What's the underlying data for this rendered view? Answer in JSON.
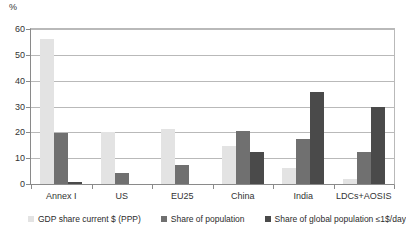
{
  "chart_data": {
    "type": "bar",
    "title": "",
    "subtitle": "",
    "xlabel": "",
    "ylabel": "%",
    "unit_label": "%",
    "ylim": [
      0,
      60
    ],
    "ytick_step": 10,
    "yticks": [
      "0",
      "10",
      "20",
      "30",
      "40",
      "50",
      "60"
    ],
    "grid": true,
    "grid_orientation": "horizontal",
    "legend_position": "bottom",
    "categories": [
      "Annex I",
      "US",
      "EU25",
      "China",
      "India",
      "LDCs+AOSIS"
    ],
    "series": [
      {
        "name": "GDP share current $ (PPP)",
        "color": "#e3e3e3",
        "values": [
          56.0,
          20.0,
          21.3,
          14.6,
          6.3,
          1.8
        ]
      },
      {
        "name": "Share of population",
        "color": "#707070",
        "values": [
          19.7,
          4.4,
          7.2,
          20.6,
          17.6,
          12.4
        ]
      },
      {
        "name": "Share of global population ≤1$/day",
        "color": "#4a4a4a",
        "values": [
          0.6,
          0.0,
          0.0,
          12.2,
          35.5,
          30.0
        ]
      }
    ]
  },
  "legend": {
    "items": [
      {
        "label": "GDP share current $ (PPP)"
      },
      {
        "label": "Share of population"
      },
      {
        "label": "Share of global population ≤1$/day"
      }
    ]
  },
  "colors": {
    "series_light": "#e3e3e3",
    "series_medium": "#707070",
    "series_dark": "#4a4a4a",
    "gridline": "#b9b9b9",
    "axis": "#8a8a8a",
    "text": "#2b2b2b",
    "background": "#ffffff"
  }
}
